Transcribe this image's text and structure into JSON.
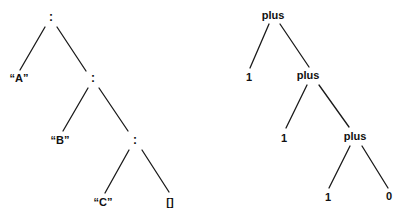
{
  "trees": [
    {
      "name": "list-cons-tree",
      "nodes": [
        {
          "id": "c1",
          "label": ":",
          "x": 51,
          "y": 17
        },
        {
          "id": "a",
          "label": "“A”",
          "x": 19,
          "y": 78
        },
        {
          "id": "c2",
          "label": ":",
          "x": 93,
          "y": 78
        },
        {
          "id": "b",
          "label": "“B”",
          "x": 60,
          "y": 140
        },
        {
          "id": "c3",
          "label": ":",
          "x": 135,
          "y": 140
        },
        {
          "id": "c",
          "label": "“C”",
          "x": 103,
          "y": 202
        },
        {
          "id": "nil",
          "label": "[]",
          "x": 170,
          "y": 202
        }
      ],
      "edges": [
        {
          "x1": 45,
          "y1": 27,
          "x2": 20,
          "y2": 70
        },
        {
          "x1": 57,
          "y1": 27,
          "x2": 86,
          "y2": 71
        },
        {
          "x1": 88,
          "y1": 88,
          "x2": 63,
          "y2": 131
        },
        {
          "x1": 99,
          "y1": 88,
          "x2": 128,
          "y2": 131
        },
        {
          "x1": 129,
          "y1": 150,
          "x2": 105,
          "y2": 193
        },
        {
          "x1": 142,
          "y1": 150,
          "x2": 169,
          "y2": 192
        }
      ]
    },
    {
      "name": "plus-tree",
      "nodes": [
        {
          "id": "p1",
          "label": "plus",
          "x": 273,
          "y": 15
        },
        {
          "id": "n1",
          "label": "1",
          "x": 249,
          "y": 77
        },
        {
          "id": "p2",
          "label": "plus",
          "x": 308,
          "y": 75
        },
        {
          "id": "n2",
          "label": "1",
          "x": 284,
          "y": 138
        },
        {
          "id": "p3",
          "label": "plus",
          "x": 355,
          "y": 136
        },
        {
          "id": "n3",
          "label": "1",
          "x": 328,
          "y": 197
        },
        {
          "id": "n4",
          "label": "0",
          "x": 389,
          "y": 196
        }
      ],
      "edges": [
        {
          "x1": 269,
          "y1": 24,
          "x2": 250,
          "y2": 68
        },
        {
          "x1": 280,
          "y1": 24,
          "x2": 309,
          "y2": 67
        },
        {
          "x1": 307,
          "y1": 85,
          "x2": 286,
          "y2": 128
        },
        {
          "x1": 319,
          "y1": 85,
          "x2": 349,
          "y2": 127
        },
        {
          "x1": 350,
          "y1": 146,
          "x2": 329,
          "y2": 188
        },
        {
          "x1": 362,
          "y1": 146,
          "x2": 388,
          "y2": 188
        }
      ]
    }
  ]
}
